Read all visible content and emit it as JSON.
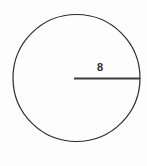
{
  "figure": {
    "background_color": "#fdfdfd",
    "stroke_color": "#2b2b2b",
    "line_color": "#3a3a3a",
    "text_color": "#2e2e2e",
    "circle": {
      "center_x": 76.5,
      "center_y": 78,
      "radius_px": 63.5,
      "stroke_width": 1.2
    },
    "radius_segment": {
      "x1": 74,
      "y1": 78.5,
      "x2": 140,
      "y2": 78.5,
      "stroke_width": 2
    },
    "radius_label": {
      "text": "8",
      "x": 97,
      "y": 62
    }
  },
  "chart_data": {
    "type": "diagram",
    "shape": "circle",
    "title": "",
    "annotations": [
      {
        "label": "8",
        "measures": "radius",
        "value": 8,
        "units": "",
        "from": "center",
        "to": "right edge"
      }
    ],
    "xlabel": "",
    "ylabel": ""
  }
}
